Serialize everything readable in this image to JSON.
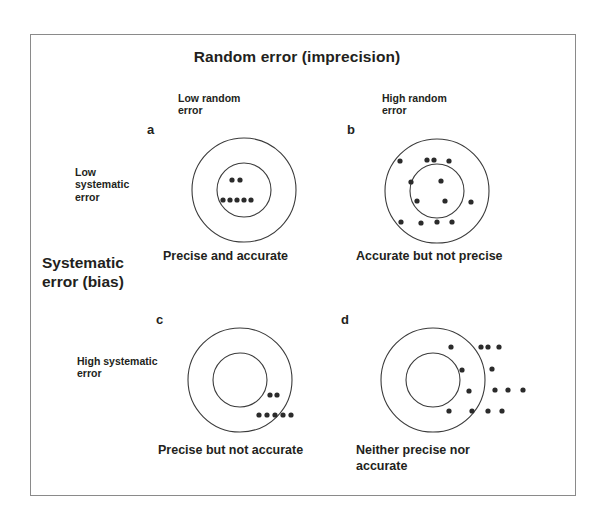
{
  "figure": {
    "title": "Random error (imprecision)",
    "vertical_axis_title": "Systematic\nerror (bias)",
    "frame_color": "#8a8a8a",
    "ring_color": "#3b3b3b",
    "dot_color": "#2b2b2b",
    "background": "#ffffff"
  },
  "column_headers": [
    {
      "key": "low_random",
      "text": "Low random\nerror"
    },
    {
      "key": "high_random",
      "text": "High random\nerror"
    }
  ],
  "row_headers": [
    {
      "key": "low_systematic",
      "text": "Low\nsystematic\nerror"
    },
    {
      "key": "high_systematic",
      "text": "High systematic\nerror"
    }
  ],
  "panels": [
    {
      "letter": "a",
      "caption": "Precise and accurate",
      "random_error": "low",
      "systematic_error": "low",
      "center": {
        "x": 244,
        "y": 190
      },
      "outer_radius": 52,
      "inner_radius": 27,
      "dot_radius": 2.6,
      "dots": [
        {
          "x": 232,
          "y": 180
        },
        {
          "x": 240,
          "y": 180
        },
        {
          "x": 223,
          "y": 200
        },
        {
          "x": 230,
          "y": 200
        },
        {
          "x": 237,
          "y": 200
        },
        {
          "x": 244,
          "y": 200
        },
        {
          "x": 251,
          "y": 200
        }
      ]
    },
    {
      "letter": "b",
      "caption": "Accurate but not precise",
      "random_error": "high",
      "systematic_error": "low",
      "center": {
        "x": 437,
        "y": 191
      },
      "outer_radius": 52,
      "inner_radius": 27,
      "dot_radius": 2.6,
      "dots": [
        {
          "x": 400,
          "y": 161
        },
        {
          "x": 427,
          "y": 160
        },
        {
          "x": 434,
          "y": 160
        },
        {
          "x": 449,
          "y": 161
        },
        {
          "x": 411,
          "y": 182
        },
        {
          "x": 441,
          "y": 181
        },
        {
          "x": 417,
          "y": 201
        },
        {
          "x": 445,
          "y": 201
        },
        {
          "x": 471,
          "y": 202
        },
        {
          "x": 401,
          "y": 222
        },
        {
          "x": 421,
          "y": 223
        },
        {
          "x": 437,
          "y": 222
        },
        {
          "x": 452,
          "y": 222
        }
      ]
    },
    {
      "letter": "c",
      "caption": "Precise but not accurate",
      "random_error": "low",
      "systematic_error": "high",
      "center": {
        "x": 240,
        "y": 380
      },
      "outer_radius": 52,
      "inner_radius": 27,
      "dot_radius": 2.6,
      "dots": [
        {
          "x": 270,
          "y": 395
        },
        {
          "x": 277,
          "y": 395
        },
        {
          "x": 259,
          "y": 415
        },
        {
          "x": 267,
          "y": 415
        },
        {
          "x": 275,
          "y": 415
        },
        {
          "x": 283,
          "y": 415
        },
        {
          "x": 291,
          "y": 415
        }
      ]
    },
    {
      "letter": "d",
      "caption": "Neither precise nor\naccurate",
      "random_error": "high",
      "systematic_error": "high",
      "center": {
        "x": 433,
        "y": 380
      },
      "outer_radius": 52,
      "inner_radius": 27,
      "dot_radius": 2.6,
      "dots": [
        {
          "x": 451,
          "y": 347
        },
        {
          "x": 481,
          "y": 347
        },
        {
          "x": 488,
          "y": 347
        },
        {
          "x": 499,
          "y": 347
        },
        {
          "x": 462,
          "y": 370
        },
        {
          "x": 492,
          "y": 369
        },
        {
          "x": 469,
          "y": 391
        },
        {
          "x": 495,
          "y": 390
        },
        {
          "x": 508,
          "y": 390
        },
        {
          "x": 523,
          "y": 390
        },
        {
          "x": 449,
          "y": 411
        },
        {
          "x": 472,
          "y": 411
        },
        {
          "x": 488,
          "y": 411
        },
        {
          "x": 502,
          "y": 411
        }
      ]
    }
  ]
}
